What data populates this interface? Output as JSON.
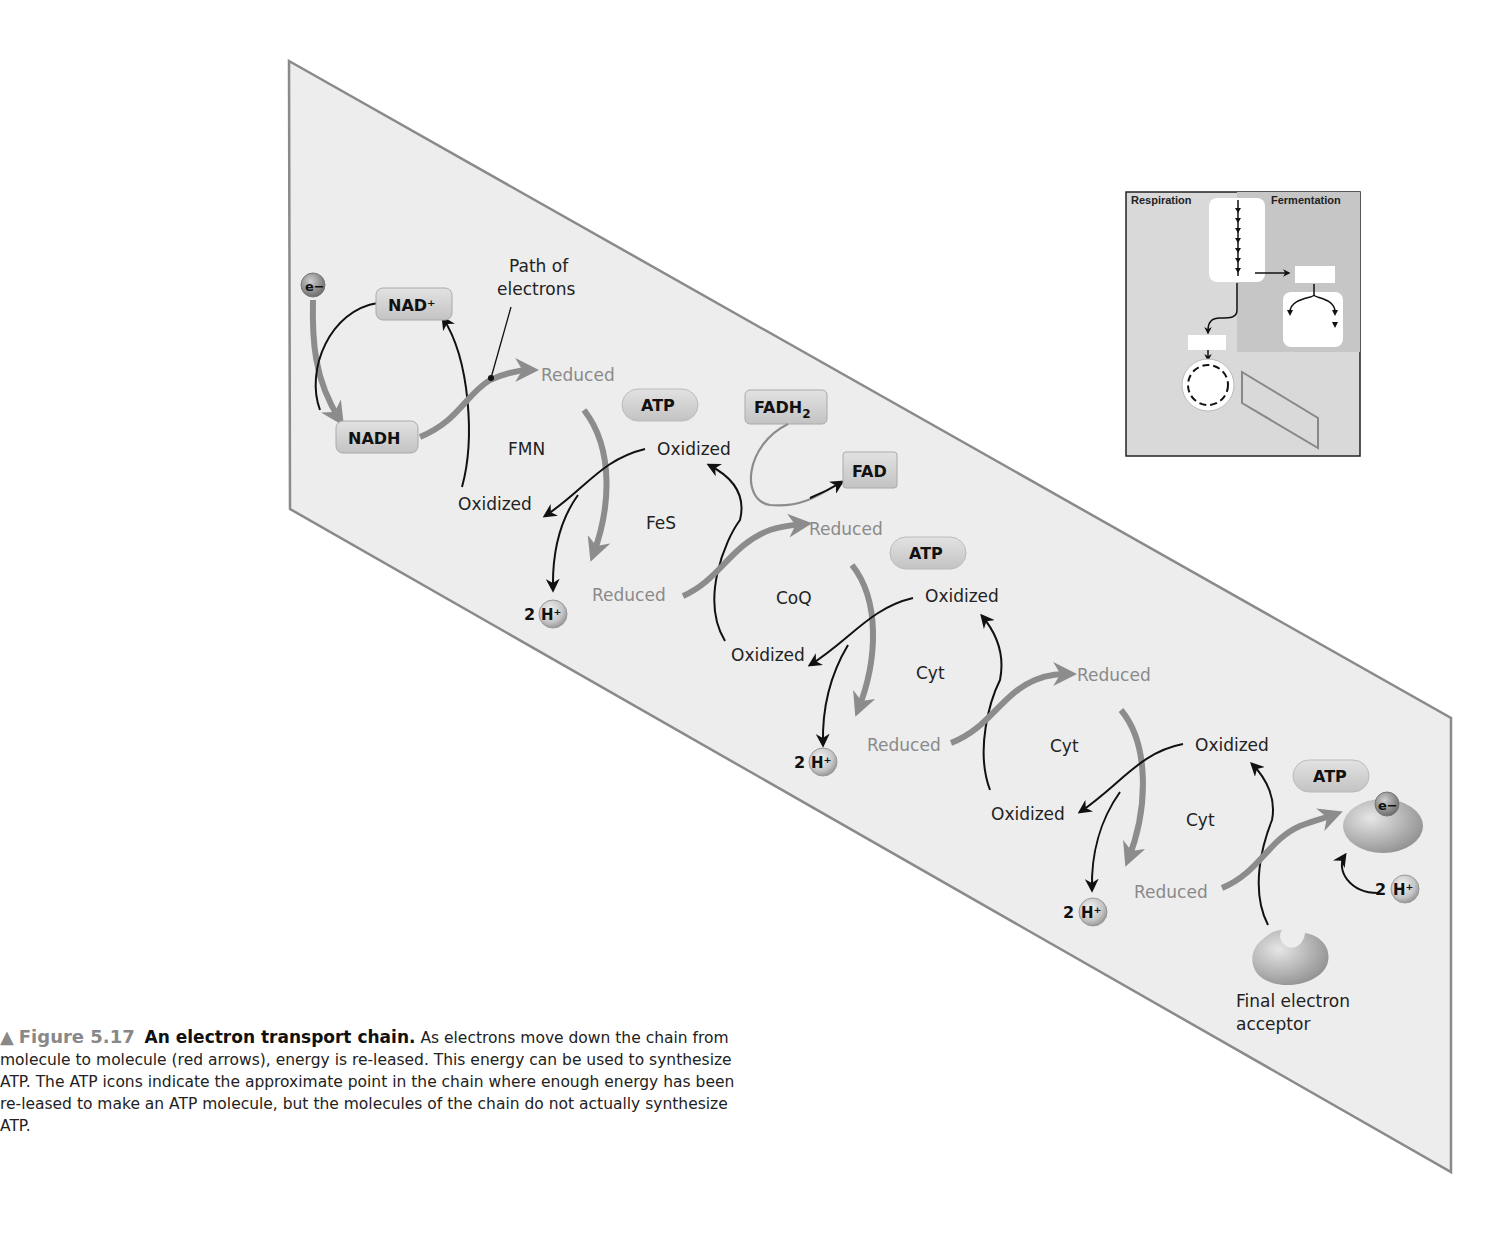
{
  "diagram": {
    "panel_color": "#ededed",
    "panel_border": "#8a8a8a",
    "electron_path_color": "#8c8c8c",
    "path_of_electrons_label": [
      "Path of",
      "electrons"
    ],
    "electron_symbol": "e−",
    "carriers": {
      "nad_plus": "NAD⁺",
      "nadh": "NADH",
      "fadh2_main": "FADH",
      "fadh2_sub": "2",
      "fad": "FAD"
    },
    "chain": [
      {
        "name": "FMN",
        "reduced": "Reduced",
        "oxidized": "Oxidized"
      },
      {
        "name": "FeS",
        "reduced": "Reduced",
        "oxidized": "Oxidized"
      },
      {
        "name": "CoQ",
        "reduced": "Reduced",
        "oxidized": "Oxidized"
      },
      {
        "name": "Cyt",
        "reduced": "Reduced",
        "oxidized": "Oxidized"
      },
      {
        "name": "Cyt",
        "reduced": "Reduced",
        "oxidized": "Oxidized"
      },
      {
        "name": "Cyt",
        "reduced": "Reduced",
        "oxidized": "Oxidized"
      }
    ],
    "atp_label": "ATP",
    "proton": {
      "count": "2",
      "symbol": "H⁺"
    },
    "final_acceptor_label": [
      "Final electron",
      "acceptor"
    ]
  },
  "inset": {
    "left_label": "Respiration",
    "right_label": "Fermentation"
  },
  "caption": {
    "marker": "▲",
    "figure_number": "Figure 5.17",
    "title": "An electron transport chain.",
    "body": "As electrons move down the chain from molecule to molecule (red arrows), energy is re-leased. This energy can be used to synthesize ATP. The ATP icons indicate the approximate point in the chain where enough energy has been re-leased to make an ATP molecule, but the molecules of the chain do not actually synthesize ATP."
  }
}
